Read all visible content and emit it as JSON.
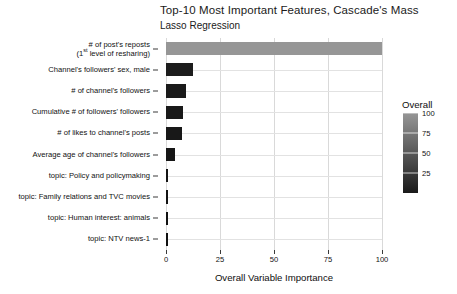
{
  "chart_data": {
    "type": "bar",
    "orientation": "horizontal",
    "title": "Top-10 Most Important Features, Cascade's Mass",
    "subtitle": "Lasso Regression",
    "xlabel": "Overall Variable Importance",
    "ylabel": "",
    "xlim": [
      0,
      100
    ],
    "xticks": [
      0,
      25,
      50,
      75,
      100
    ],
    "xtick_labels": [
      "0",
      "25",
      "50",
      "75",
      "100"
    ],
    "grid": true,
    "legend": {
      "title": "Overall",
      "position": "right",
      "type": "colorbar",
      "ticks": [
        100,
        75,
        50,
        25
      ],
      "tick_labels": [
        "100",
        "75",
        "50",
        "25"
      ],
      "range": [
        0,
        100
      ],
      "color_low": "#1a1a1a",
      "color_high": "#969696"
    },
    "categories": [
      "# of post's reposts (1st level of resharing)",
      "Channel's followers' sex, male",
      "# of channel's followers",
      "Cumulative # of followers' followers",
      "# of likes to channel's posts",
      "Average age of channel's followers",
      "topic: Policy and policymaking",
      "topic: Family relations and TVC movies",
      "topic: Human interest: animals",
      "topic: NTV news-1"
    ],
    "category_labels": [
      {
        "line1": "# of post's reposts",
        "line2_pre": "(1",
        "line2_sup": "st",
        "line2_post": " level of resharing)"
      },
      {
        "line1": "Channel's followers' sex, male"
      },
      {
        "line1": "# of channel's followers"
      },
      {
        "line1": "Cumulative # of followers' followers"
      },
      {
        "line1": "# of likes to channel's posts"
      },
      {
        "line1": "Average age of channel's followers"
      },
      {
        "line1": "topic: Policy and policymaking"
      },
      {
        "line1": "topic: Family relations and TVC movies"
      },
      {
        "line1": "topic: Human interest: animals"
      },
      {
        "line1": "topic: NTV news-1"
      }
    ],
    "values": [
      100,
      12.5,
      9.2,
      8.1,
      7.6,
      4.2,
      1.1,
      0.9,
      0.7,
      0.5
    ],
    "bar_colors": [
      "#969696",
      "#1d1d1d",
      "#1a1a1a",
      "#191919",
      "#181818",
      "#161616",
      "#141414",
      "#131313",
      "#121212",
      "#111111"
    ]
  }
}
